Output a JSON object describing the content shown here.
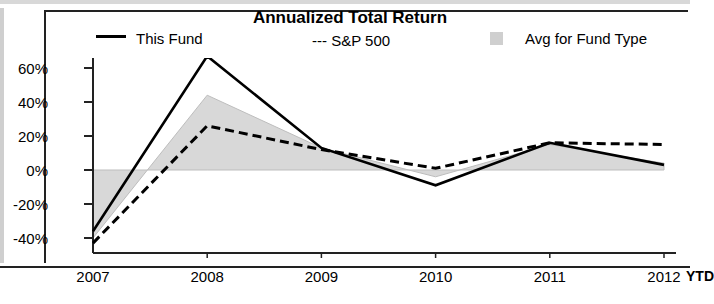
{
  "chart_data": {
    "type": "line",
    "title": "Annualized Total Return",
    "xlabel": "",
    "ylabel": "",
    "x": [
      "2007",
      "2008",
      "2009",
      "2010",
      "2011",
      "2012"
    ],
    "x_note": "YTD",
    "ylim": [
      -40,
      60
    ],
    "yticks": [
      60,
      40,
      20,
      0,
      -20,
      -40
    ],
    "ytick_labels": [
      "60%",
      "40%",
      "20%",
      "0%",
      "-20%",
      "-40%"
    ],
    "grid": false,
    "legend_position": "top",
    "series": [
      {
        "name": "This Fund",
        "style": "solid",
        "color": "#000000",
        "values": [
          -36,
          67,
          13,
          -9,
          16,
          3
        ]
      },
      {
        "name": "S&P 500",
        "style": "dashed",
        "color": "#000000",
        "values": [
          -43,
          26,
          12,
          1,
          16,
          15
        ]
      },
      {
        "name": "Avg for Fund Type",
        "style": "filled-band",
        "color": "#d4d4d4",
        "values": [
          -40,
          44,
          13,
          -4,
          15,
          4
        ]
      }
    ]
  },
  "legend": {
    "items": [
      {
        "label": "This Fund",
        "swatch": "solid-line-swatch"
      },
      {
        "label": "--- S&P 500",
        "swatch": "dashed-line-swatch"
      },
      {
        "label": "Avg for Fund Type",
        "swatch": "gray-box-swatch"
      }
    ]
  },
  "colors": {
    "line": "#000000",
    "band_fill": "#d8d8d8",
    "band_stroke": "#bdbdbd",
    "axis": "#222222",
    "background": "#ffffff"
  }
}
